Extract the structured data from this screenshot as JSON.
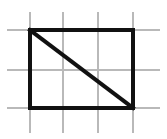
{
  "figure": {
    "canvas": {
      "width": 167,
      "height": 139,
      "background": "#ffffff"
    },
    "colors": {
      "grid": "#b9b9b9",
      "shape": "#111111",
      "background": "#ffffff"
    },
    "strokes": {
      "grid_width": 2,
      "shape_width": 4,
      "diagonal_width": 4
    },
    "grid": {
      "vertical_lines": [
        {
          "name": "grid-vline-1",
          "x": 30,
          "y1": 12,
          "y2": 133
        },
        {
          "name": "grid-vline-2",
          "x": 63,
          "y1": 12,
          "y2": 133
        },
        {
          "name": "grid-vline-3",
          "x": 98,
          "y1": 12,
          "y2": 133
        },
        {
          "name": "grid-vline-4",
          "x": 133,
          "y1": 12,
          "y2": 133
        }
      ],
      "horizontal_lines": [
        {
          "name": "grid-hline-1",
          "y": 30,
          "x1": 7,
          "x2": 160
        },
        {
          "name": "grid-hline-2",
          "y": 70,
          "x1": 7,
          "x2": 160
        },
        {
          "name": "grid-hline-3",
          "y": 108,
          "x1": 7,
          "x2": 160
        }
      ],
      "columns": 3,
      "rows": 2
    },
    "rectangle": {
      "name": "rectangle-outline",
      "left": 30,
      "top": 30,
      "right": 133,
      "bottom": 108,
      "width": 103,
      "height": 78,
      "grid_cells_wide": 3,
      "grid_cells_tall": 2
    },
    "diagonal": {
      "name": "diagonal-line",
      "from": {
        "x": 30,
        "y": 30
      },
      "to": {
        "x": 133,
        "y": 108
      },
      "direction": "top-left to bottom-right"
    }
  }
}
